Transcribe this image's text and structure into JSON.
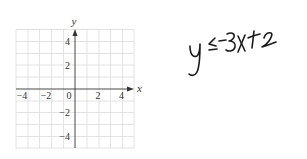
{
  "graph": {
    "x_axis_label": "x",
    "y_axis_label": "y",
    "x_ticks": [
      "−4",
      "−2",
      "0",
      "2",
      "4"
    ],
    "y_ticks": [
      "4",
      "2",
      "−2",
      "−4"
    ],
    "x_range": [
      -5,
      5
    ],
    "y_range": [
      -5,
      5
    ],
    "grid": true
  },
  "handwriting": {
    "text": "y ≤ -3x + 2"
  },
  "colors": {
    "grid": "#d9d9d9",
    "axis": "#333333",
    "ink": "#1a1a1a"
  }
}
